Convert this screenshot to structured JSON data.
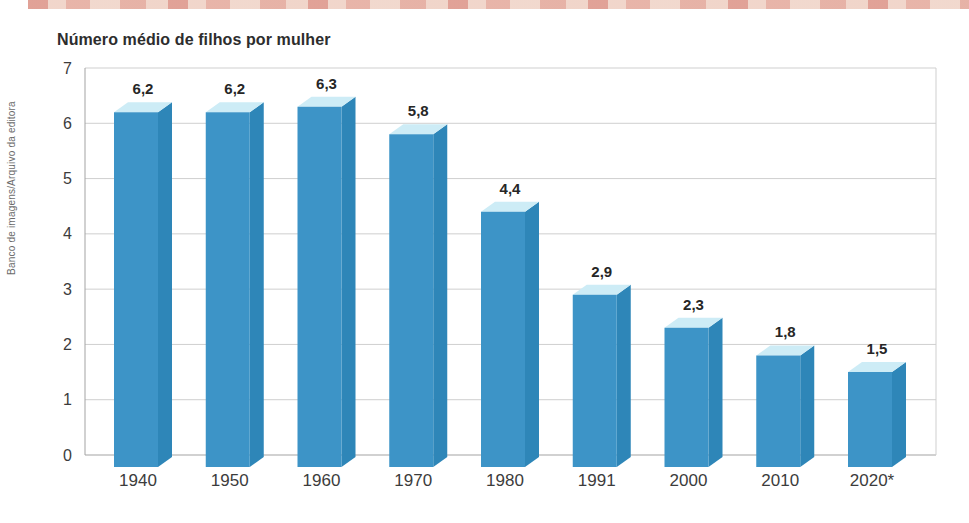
{
  "page": {
    "credit": "Banco de imagens/Arquivo da editora"
  },
  "chart_data": {
    "type": "bar",
    "title": "Número médio de filhos por mulher",
    "categories": [
      "1940",
      "1950",
      "1960",
      "1970",
      "1980",
      "1991",
      "2000",
      "2010",
      "2020*"
    ],
    "values": [
      6.2,
      6.2,
      6.3,
      5.8,
      4.4,
      2.9,
      2.3,
      1.8,
      1.5
    ],
    "value_labels": [
      "6,2",
      "6,2",
      "6,3",
      "5,8",
      "4,4",
      "2,9",
      "2,3",
      "1,8",
      "1,5"
    ],
    "xlabel": "",
    "ylabel": "",
    "ylim": [
      0,
      7
    ],
    "yticks": [
      0,
      1,
      2,
      3,
      4,
      5,
      6,
      7
    ],
    "grid": true,
    "legend": "none",
    "colors": {
      "bar_front": "#3d94c7",
      "bar_top": "#cdecf6",
      "bar_side": "#2e86b8",
      "gridline": "#cfcfcf",
      "axis_line": "#a3a3a3",
      "tick_text": "#3c3c3c",
      "value_text": "#262626"
    }
  }
}
